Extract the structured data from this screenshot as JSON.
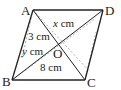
{
  "figure": {
    "type": "parallelogram",
    "vertices": {
      "A": {
        "label": "A",
        "x": 33,
        "y": 10
      },
      "B": {
        "label": "B",
        "x": 12,
        "y": 80
      },
      "C": {
        "label": "C",
        "x": 85,
        "y": 80
      },
      "D": {
        "label": "D",
        "x": 103,
        "y": 10
      },
      "O": {
        "label": "O",
        "x": 57,
        "y": 45
      }
    },
    "measurements": {
      "x": {
        "var": "x",
        "unit": " cm"
      },
      "ao": {
        "value": "3 cm"
      },
      "y": {
        "var": "y",
        "unit": " cm"
      },
      "bo": {
        "value": "8 cm"
      }
    },
    "colors": {
      "stroke": "#222222",
      "dashed": "#9a9a9a"
    }
  }
}
